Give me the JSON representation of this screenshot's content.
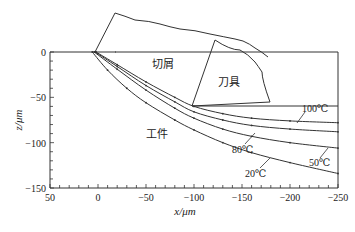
{
  "chart_data": {
    "type": "line",
    "title": "",
    "xlabel": "x/μm",
    "ylabel": "z/μm",
    "xlim": [
      50,
      -250
    ],
    "ylim": [
      -150,
      0
    ],
    "x_ticks": [
      "50",
      "0",
      "-50",
      "-100",
      "-150",
      "-200",
      "-250"
    ],
    "y_ticks": [
      "0",
      "-50",
      "-100",
      "-150"
    ],
    "grid": false,
    "legend": "inline labels with leader lines",
    "region_labels": {
      "chip": "切屑",
      "tool": "刀具",
      "workpiece": "工件"
    },
    "series": [
      {
        "name": "100℃",
        "x": [
          2,
          -20,
          -50,
          -80,
          -100,
          -130,
          -160,
          -200,
          -250
        ],
        "z": [
          0,
          -14,
          -33,
          -50,
          -60,
          -68,
          -73,
          -76,
          -78
        ]
      },
      {
        "name": "80℃",
        "x": [
          3,
          -20,
          -50,
          -80,
          -100,
          -130,
          -160,
          -200,
          -250
        ],
        "z": [
          0,
          -16,
          -37,
          -55,
          -66,
          -75,
          -81,
          -85,
          -88
        ]
      },
      {
        "name": "50℃",
        "x": [
          4,
          -20,
          -50,
          -80,
          -100,
          -130,
          -160,
          -200,
          -250
        ],
        "z": [
          0,
          -19,
          -42,
          -62,
          -73,
          -85,
          -93,
          -100,
          -106
        ]
      },
      {
        "name": "20℃",
        "x": [
          6,
          -10,
          -30,
          -50,
          -80,
          -100,
          -130,
          -160,
          -200,
          -250
        ],
        "z": [
          0,
          -20,
          -40,
          -56,
          -75,
          -86,
          -100,
          -111,
          -122,
          -134
        ]
      }
    ],
    "annotations": {
      "tool_flank_line_z": -60,
      "tool_tip_x": -95
    }
  }
}
